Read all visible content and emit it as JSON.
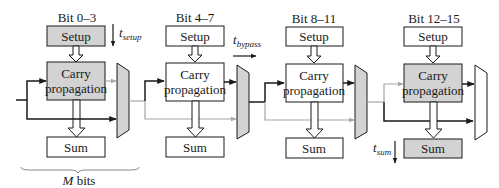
{
  "colors": {
    "shaded": "#d3d3d3",
    "white": "#ffffff",
    "stroke": "#1a1a1a",
    "gray_path": "#a6a6a6"
  },
  "stages": [
    {
      "label": "Bit 0–3",
      "setup": "Setup",
      "carry_l1": "Carry",
      "carry_l2": "propagation",
      "sum": "Sum",
      "shaded_setup": true,
      "shaded_carry": true,
      "shaded_sum": false
    },
    {
      "label": "Bit 4–7",
      "setup": "Setup",
      "carry_l1": "Carry",
      "carry_l2": "propagation",
      "sum": "Sum",
      "shaded_setup": false,
      "shaded_carry": false,
      "shaded_sum": false
    },
    {
      "label": "Bit 8–11",
      "setup": "Setup",
      "carry_l1": "Carry",
      "carry_l2": "propagation",
      "sum": "Sum",
      "shaded_setup": false,
      "shaded_carry": false,
      "shaded_sum": false
    },
    {
      "label": "Bit 12–15",
      "setup": "Setup",
      "carry_l1": "Carry",
      "carry_l2": "propagation",
      "sum": "Sum",
      "shaded_setup": false,
      "shaded_carry": true,
      "shaded_sum": true
    }
  ],
  "annotations": {
    "t_setup_base": "t",
    "t_setup_sub": "setup",
    "t_bypass_base": "t",
    "t_bypass_sub": "bypass",
    "t_sum_base": "t",
    "t_sum_sub": "sum",
    "m_bits_var": "M",
    "m_bits_text": " bits"
  }
}
